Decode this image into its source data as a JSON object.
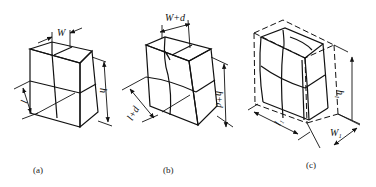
{
  "figure": {
    "panels": [
      {
        "id": "a",
        "caption": "(a)",
        "labels": {
          "width": "W",
          "height": "h",
          "length": "l"
        }
      },
      {
        "id": "b",
        "caption": "(b)",
        "labels": {
          "width": "W+d",
          "height": "h+d",
          "length": "l+d"
        }
      },
      {
        "id": "c",
        "caption": "(c)",
        "labels": {
          "width": "W₁",
          "height": "h₁",
          "length": "l₁"
        }
      }
    ]
  }
}
